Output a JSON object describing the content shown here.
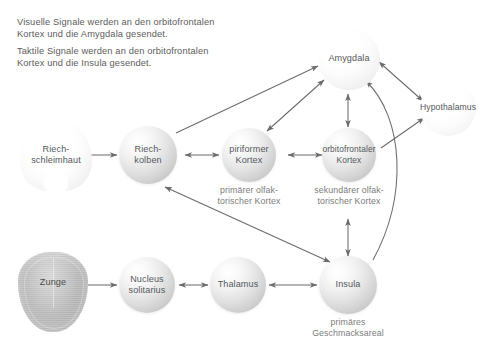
{
  "diagram": {
    "intro": [
      "Visuelle Signale werden an den orbitofrontalen\nKortex und die Amygdala gesendet.",
      "Taktile Signale werden an den orbitofrontalen\nKortex und die Insula gesendet."
    ],
    "nodes": [
      {
        "id": "riechschleimhaut",
        "label": "Riech-\nschleimhaut"
      },
      {
        "id": "riechkolben",
        "label": "Riech-\nkolben"
      },
      {
        "id": "piriformer",
        "label": "piriformer\nKortex"
      },
      {
        "id": "orbitofrontaler",
        "label": "orbitofrontaler\nKortex"
      },
      {
        "id": "amygdala",
        "label": "Amygdala"
      },
      {
        "id": "hypothalamus",
        "label": "Hypothalamus"
      },
      {
        "id": "zunge",
        "label": "Zunge"
      },
      {
        "id": "nucleus",
        "label": "Nucleus\nsolitarius"
      },
      {
        "id": "thalamus",
        "label": "Thalamus"
      },
      {
        "id": "insula",
        "label": "Insula"
      }
    ],
    "captions": [
      {
        "id": "cap-piriformer",
        "text": "primärer olfak-\ntorischer Kortex"
      },
      {
        "id": "cap-orbitofrontaler",
        "text": "sekundärer olfak-\ntorischer Kortex"
      },
      {
        "id": "cap-insula",
        "text": "primäres\nGeschmacksareal"
      }
    ],
    "edges": [
      {
        "from": "riechschleimhaut",
        "to": "riechkolben",
        "direction": "one-way"
      },
      {
        "from": "riechkolben",
        "to": "piriformer",
        "direction": "two-way"
      },
      {
        "from": "piriformer",
        "to": "orbitofrontaler",
        "direction": "two-way"
      },
      {
        "from": "riechkolben",
        "to": "amygdala",
        "direction": "one-way"
      },
      {
        "from": "piriformer",
        "to": "amygdala",
        "direction": "two-way"
      },
      {
        "from": "amygdala",
        "to": "orbitofrontaler",
        "direction": "two-way"
      },
      {
        "from": "amygdala",
        "to": "hypothalamus",
        "direction": "two-way"
      },
      {
        "from": "orbitofrontaler",
        "to": "hypothalamus",
        "direction": "one-way"
      },
      {
        "from": "orbitofrontaler",
        "to": "insula",
        "direction": "two-way"
      },
      {
        "from": "insula",
        "to": "amygdala",
        "direction": "one-way",
        "shape": "curved"
      },
      {
        "from": "insula",
        "to": "riechkolben",
        "direction": "two-way"
      },
      {
        "from": "zunge",
        "to": "nucleus",
        "direction": "one-way"
      },
      {
        "from": "nucleus",
        "to": "thalamus",
        "direction": "two-way"
      },
      {
        "from": "thalamus",
        "to": "insula",
        "direction": "two-way"
      }
    ],
    "colors": {
      "background": "#ffffff",
      "text": "#5d5d5d",
      "node_text": "#54585c",
      "caption_text": "#7c7c7c",
      "edge": "#6b6b6b",
      "tongue": "#b2b2b2"
    }
  }
}
